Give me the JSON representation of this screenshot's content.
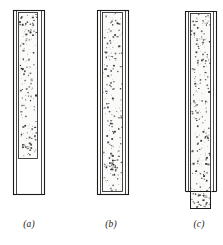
{
  "figure": {
    "type": "technical-illustration",
    "background_color": "#ffffff",
    "line_color": "#1a1a1a",
    "speckle_color": "#2b2b2b",
    "fill_color": "#fafaf8",
    "panels": [
      {
        "id": "a",
        "caption": "(a)",
        "caption_x": 29,
        "caption_y": 226,
        "outer_tube": {
          "x": 13,
          "y": 10,
          "width": 31,
          "height": 184
        },
        "inner_wall_inset": 3,
        "packing": {
          "x": 18,
          "y": 12,
          "width": 20,
          "height": 147
        },
        "packing_state": "partially filled, bed ends above tube bottom",
        "protrudes_below": false,
        "speckle_count": 170
      },
      {
        "id": "b",
        "caption": "(b)",
        "caption_x": 111,
        "caption_y": 226,
        "outer_tube": {
          "x": 97,
          "y": 10,
          "width": 31,
          "height": 184
        },
        "inner_wall_inset": 3,
        "packing": {
          "x": 102,
          "y": 12,
          "width": 21,
          "height": 180
        },
        "packing_state": "completely filled to tube bottom",
        "protrudes_below": false,
        "speckle_count": 230
      },
      {
        "id": "c",
        "caption": "(c)",
        "caption_x": 199,
        "caption_y": 226,
        "outer_tube": {
          "x": 185,
          "y": 11,
          "width": 31,
          "height": 180
        },
        "inner_wall_inset": 3,
        "packing": {
          "x": 190,
          "y": 13,
          "width": 21,
          "height": 196
        },
        "packing_state": "filled and extruded below the tube outlet",
        "protrudes_below": true,
        "protrusion": {
          "x": 190,
          "y": 191,
          "width": 21,
          "height": 18
        },
        "speckle_count": 240
      }
    ]
  }
}
